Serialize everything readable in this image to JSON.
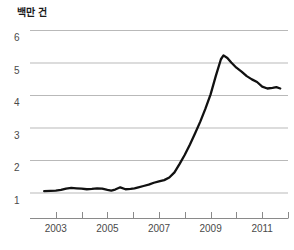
{
  "chart_data": {
    "type": "line",
    "title": "백만 건",
    "subtitle": "",
    "xlabel": "",
    "ylabel": "백만 건",
    "grid": true,
    "legend": "none",
    "xlim": [
      2002.0,
      2012.0
    ],
    "ylim": [
      0.6,
      6.4
    ],
    "yticks": [
      1,
      2,
      3,
      4,
      5,
      6
    ],
    "ytick_labels": [
      "1",
      "2",
      "3",
      "4",
      "5",
      "6"
    ],
    "xticks": [
      2003,
      2004,
      2005,
      2006,
      2007,
      2008,
      2009,
      2010,
      2011,
      2012
    ],
    "xtick_labels_shown": [
      "2003",
      "2005",
      "2007",
      "2009",
      "2011"
    ],
    "xtick_label_values": [
      2003,
      2005,
      2007,
      2009,
      2011
    ],
    "line_color": "#111111",
    "grid_color": "#b9b9b9",
    "axis_color": "#8a8a8a",
    "series": [
      {
        "name": "건수",
        "x": [
          2002.55,
          2002.8,
          2003.0,
          2003.2,
          2003.4,
          2003.6,
          2003.8,
          2004.0,
          2004.2,
          2004.4,
          2004.6,
          2004.8,
          2005.0,
          2005.15,
          2005.3,
          2005.5,
          2005.7,
          2005.9,
          2006.05,
          2006.2,
          2006.4,
          2006.6,
          2006.8,
          2007.0,
          2007.2,
          2007.4,
          2007.6,
          2007.8,
          2008.0,
          2008.2,
          2008.4,
          2008.6,
          2008.8,
          2009.0,
          2009.2,
          2009.4,
          2009.5,
          2009.65,
          2009.8,
          2010.0,
          2010.2,
          2010.4,
          2010.6,
          2010.8,
          2011.0,
          2011.2,
          2011.4,
          2011.55,
          2011.7
        ],
        "values": [
          1.04,
          1.05,
          1.06,
          1.08,
          1.12,
          1.14,
          1.13,
          1.12,
          1.1,
          1.11,
          1.13,
          1.12,
          1.08,
          1.06,
          1.09,
          1.16,
          1.1,
          1.11,
          1.13,
          1.16,
          1.2,
          1.24,
          1.3,
          1.34,
          1.38,
          1.46,
          1.62,
          1.88,
          2.16,
          2.48,
          2.82,
          3.18,
          3.58,
          4.02,
          4.58,
          5.1,
          5.22,
          5.14,
          5.0,
          4.84,
          4.72,
          4.58,
          4.48,
          4.4,
          4.26,
          4.2,
          4.22,
          4.24,
          4.2
        ]
      }
    ]
  }
}
